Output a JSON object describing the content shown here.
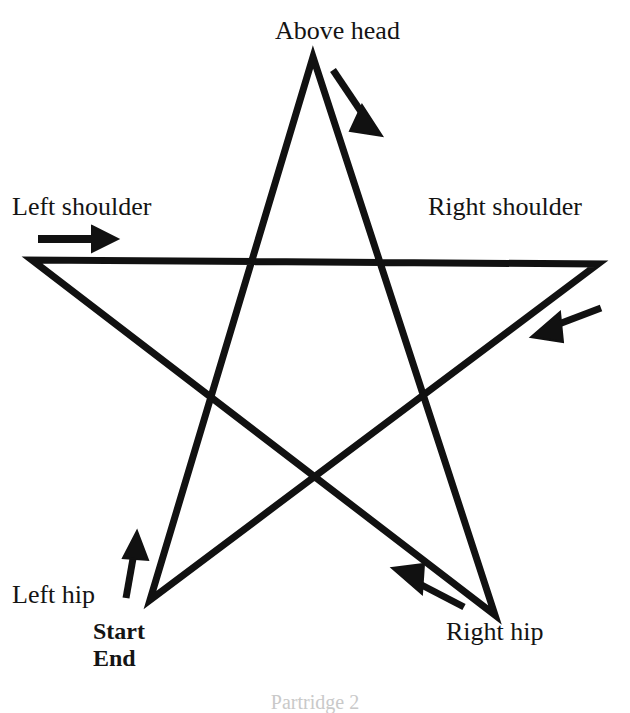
{
  "figure": {
    "kind": "instructional-diagram",
    "background_color": "#ffffff",
    "ink_color": "#111111",
    "stroke_width_px": 7
  },
  "labels": {
    "above_head": "Above head",
    "left_shoulder": "Left shoulder",
    "right_shoulder": "Right shoulder",
    "left_hip": "Left hip",
    "right_hip": "Right hip",
    "start": "Start",
    "end": "End",
    "caption": "Partridge 2"
  },
  "star": {
    "description": "Five-pointed star drawn as one continuous unicursal path",
    "points": [
      {
        "name": "above-head",
        "label": "Above head",
        "x": 313,
        "y": 57
      },
      {
        "name": "left-shoulder",
        "label": "Left shoulder",
        "x": 32,
        "y": 260
      },
      {
        "name": "right-shoulder",
        "label": "Right shoulder",
        "x": 598,
        "y": 264
      },
      {
        "name": "left-hip",
        "label": "Left hip",
        "x": 150,
        "y": 600
      },
      {
        "name": "right-hip",
        "label": "Right hip",
        "x": 495,
        "y": 615
      }
    ],
    "path_order": [
      "left-hip",
      "above-head",
      "right-hip",
      "left-shoulder",
      "right-shoulder",
      "left-hip"
    ],
    "path_d": "M 150 600 L 313 57 L 495 615 L 32 260 L 598 264 Z"
  },
  "arrows": [
    {
      "name": "arrow-head-to-right-hip",
      "near": "above-head",
      "direction": "down-right",
      "x1": 333,
      "y1": 70,
      "x2": 372,
      "y2": 128
    },
    {
      "name": "arrow-left-shoulder-to-right-shoulder",
      "near": "left-shoulder",
      "direction": "right",
      "x1": 38,
      "y1": 239,
      "x2": 113,
      "y2": 239
    },
    {
      "name": "arrow-right-shoulder-to-left-hip",
      "near": "right-shoulder",
      "direction": "down-left",
      "x1": 601,
      "y1": 308,
      "x2": 534,
      "y2": 334
    },
    {
      "name": "arrow-right-hip-to-left-shoulder",
      "near": "right-hip",
      "direction": "up-left",
      "x1": 462,
      "y1": 606,
      "x2": 396,
      "y2": 571
    },
    {
      "name": "arrow-left-hip-to-above-head",
      "near": "left-hip",
      "direction": "up",
      "x1": 127,
      "y1": 597,
      "x2": 137,
      "y2": 536
    }
  ]
}
